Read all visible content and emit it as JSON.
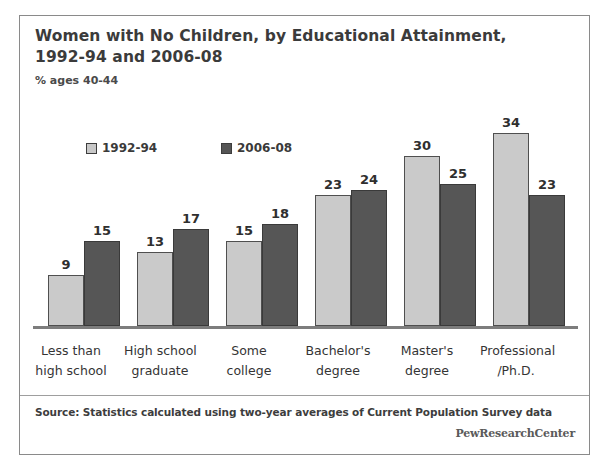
{
  "figure": {
    "title_line1": "Women with No Children, by Educational Attainment,",
    "title_line2": "1992-94 and 2006-08",
    "subtitle": "% ages 40-44",
    "source": "Source: Statistics calculated using two-year averages of Current Population Survey data",
    "brand": "PewResearchCenter",
    "frame_color": "#8a8a8a"
  },
  "legend": {
    "items": [
      {
        "label": "1992-94",
        "color": "#c8c8c8",
        "swatch": "light-swatch-icon"
      },
      {
        "label": "2006-08",
        "color": "#555555",
        "swatch": "dark-swatch-icon"
      }
    ]
  },
  "chart_data": {
    "type": "bar",
    "title": "Women with No Children, by Educational Attainment, 1992-94 and 2006-08",
    "subtitle": "% ages 40-44",
    "xlabel": "",
    "ylabel": "% ages 40-44",
    "ylim": [
      0,
      36
    ],
    "grid": false,
    "legend_position": "top-left",
    "categories": [
      "Less than high school",
      "High school graduate",
      "Some college",
      "Bachelor's degree",
      "Master's degree",
      "Professional /Ph.D."
    ],
    "category_lines": [
      [
        "Less than",
        "high school"
      ],
      [
        "High school",
        "graduate"
      ],
      [
        "Some",
        "college"
      ],
      [
        "Bachelor's",
        "degree"
      ],
      [
        "Master's",
        "degree"
      ],
      [
        "Professional",
        "/Ph.D."
      ]
    ],
    "series": [
      {
        "name": "1992-94",
        "color": "#c8c8c8",
        "values": [
          9,
          13,
          15,
          23,
          30,
          34
        ]
      },
      {
        "name": "2006-08",
        "color": "#555555",
        "values": [
          15,
          17,
          18,
          24,
          25,
          23
        ]
      }
    ],
    "annotations": [
      "Source: Statistics calculated using two-year averages of Current Population Survey data"
    ]
  }
}
